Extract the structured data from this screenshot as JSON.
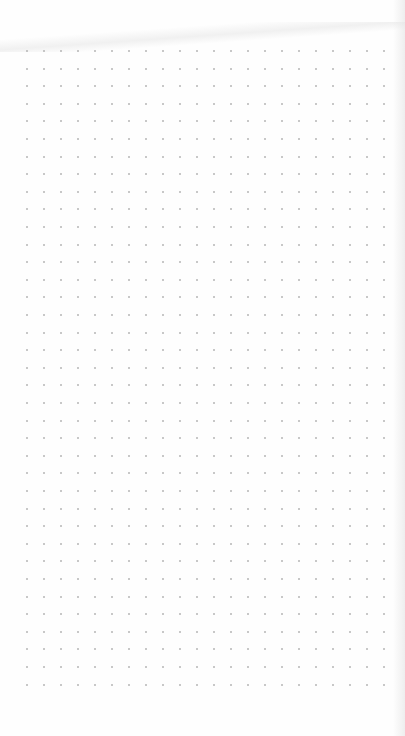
{
  "page": {
    "type": "dot-grid-paper",
    "background_color": "#fefefe",
    "dot_color": "#b6b6b6"
  },
  "grid": {
    "columns": 22,
    "rows": 37,
    "origin_x": 27,
    "origin_y": 51,
    "spacing_x": 17,
    "spacing_y": 17.6
  }
}
